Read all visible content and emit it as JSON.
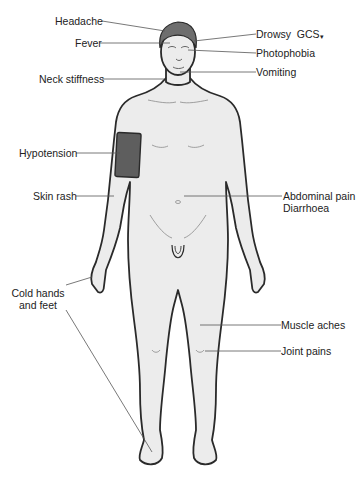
{
  "diagram": {
    "colors": {
      "skin": "#ececec",
      "outline": "#2a2a2a",
      "hair": "#6e6e6e",
      "cuff": "#5e5e5e",
      "leader_line": "#555555",
      "text": "#222222"
    },
    "labels_left": [
      {
        "id": "headache",
        "text": "Headache"
      },
      {
        "id": "fever",
        "text": "Fever"
      },
      {
        "id": "neck_stiffness",
        "text": "Neck stiffness"
      },
      {
        "id": "hypotension",
        "text": "Hypotension"
      },
      {
        "id": "skin_rash",
        "text": "Skin rash"
      },
      {
        "id": "cold_hands_feet",
        "line1": "Cold hands",
        "line2": "and feet"
      }
    ],
    "labels_right": [
      {
        "id": "drowsy",
        "text": "Drowsy",
        "gcs": "GCS",
        "gcs_arrow": "▾"
      },
      {
        "id": "photophobia",
        "text": "Photophobia"
      },
      {
        "id": "vomiting",
        "text": "Vomiting"
      },
      {
        "id": "abdominal_pain",
        "line1": "Abdominal pain",
        "line2": "Diarrhoea"
      },
      {
        "id": "muscle_aches",
        "text": "Muscle aches"
      },
      {
        "id": "joint_pains",
        "text": "Joint pains"
      }
    ]
  }
}
